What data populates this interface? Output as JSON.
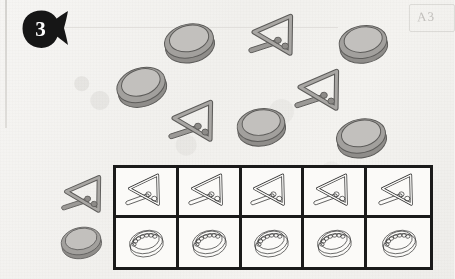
{
  "page": {
    "kind": "worksheet-scan",
    "paper_color": "#f4f3f1",
    "ink_color": "#1a1a1a",
    "object_fill": "#a8a6a3",
    "object_stroke": "#5d5c5a"
  },
  "badge": {
    "number": "3",
    "shape": "circle-with-tail",
    "fill": "#161616",
    "text_color": "#ffffff"
  },
  "corner_stamp": {
    "text": "A3",
    "visible": true
  },
  "scatter": {
    "caption": "",
    "tambourine_count": 5,
    "triangle_count": 3,
    "items": [
      {
        "type": "tambourine",
        "name": "tambourine",
        "x": 158,
        "y": 10,
        "size": 62,
        "rotate": -12
      },
      {
        "type": "tambourine",
        "name": "tambourine",
        "x": 110,
        "y": 54,
        "size": 62,
        "rotate": -18
      },
      {
        "type": "tambourine",
        "name": "tambourine",
        "x": 333,
        "y": 12,
        "size": 60,
        "rotate": -10
      },
      {
        "type": "tambourine",
        "name": "tambourine",
        "x": 231,
        "y": 95,
        "size": 60,
        "rotate": -9
      },
      {
        "type": "tambourine",
        "name": "tambourine",
        "x": 330,
        "y": 105,
        "size": 62,
        "rotate": -12
      },
      {
        "type": "triangle",
        "name": "triangle",
        "x": 247,
        "y": 8,
        "size": 56,
        "rotate": 6
      },
      {
        "type": "triangle",
        "name": "triangle",
        "x": 293,
        "y": 63,
        "size": 56,
        "rotate": 6
      },
      {
        "type": "triangle",
        "name": "triangle",
        "x": 167,
        "y": 94,
        "size": 56,
        "rotate": 6
      }
    ]
  },
  "row_keys": [
    {
      "type": "triangle",
      "label": "triangle-key"
    },
    {
      "type": "tambourine",
      "label": "tambourine-key"
    }
  ],
  "grid": {
    "columns": 5,
    "rows": 2,
    "border_color": "#1a1a1a",
    "border_width_px": 3,
    "row_items": [
      {
        "row": 1,
        "type": "triangle",
        "cells": [
          "triangle",
          "triangle",
          "triangle",
          "triangle",
          "triangle"
        ]
      },
      {
        "row": 2,
        "type": "tambourine",
        "cells": [
          "tambourine",
          "tambourine",
          "tambourine",
          "tambourine",
          "tambourine"
        ]
      }
    ]
  },
  "chart_data": {
    "type": "bar",
    "categories": [
      "triangle",
      "tambourine"
    ],
    "values": [
      3,
      5
    ],
    "xlabel": "instrument",
    "ylabel": "count",
    "ylim": [
      0,
      5
    ]
  }
}
